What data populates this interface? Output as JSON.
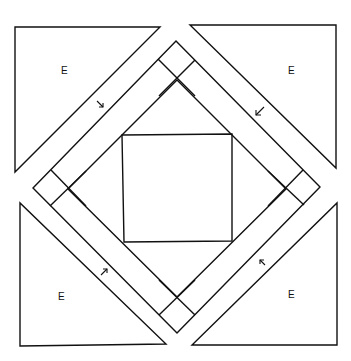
{
  "diagram": {
    "type": "quilt-block-pattern",
    "background": "#ffffff",
    "stroke_color": "#111111",
    "corner_triangles": [
      {
        "position": "top-left",
        "label": "E",
        "points": "15,27 160,27 15,172",
        "label_xy": [
          61,
          74
        ]
      },
      {
        "position": "top-right",
        "label": "E",
        "points": "190,25 336,25 336,168",
        "label_xy": [
          290,
          74
        ]
      },
      {
        "position": "bottom-left",
        "label": "E",
        "points": "20,203 20,346 166,344",
        "label_xy": [
          61,
          300
        ]
      },
      {
        "position": "bottom-right",
        "label": "E",
        "points": "192,345 337,345 337,203",
        "label_xy": [
          292,
          298
        ]
      }
    ],
    "outer_diamond": "176,41 320,187 177,333 33,188",
    "inner_diamond": "177,80 286,189 177,297 68,189",
    "center_square": "122,135 232,134 232,241 124,242",
    "arrows": [
      {
        "name": "arrow-down-right",
        "direction": "down-right",
        "x": 99,
        "y": 104
      },
      {
        "name": "arrow-down-left",
        "direction": "down-left",
        "x": 260,
        "y": 112
      },
      {
        "name": "arrow-up-right",
        "direction": "up-right",
        "x": 104,
        "y": 272
      },
      {
        "name": "arrow-up-left",
        "direction": "up-left",
        "x": 263,
        "y": 263
      }
    ]
  }
}
